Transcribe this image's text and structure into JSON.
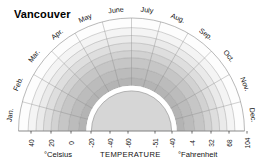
{
  "title": "Vancouver",
  "chart_data": {
    "type": "area",
    "subtype": "semicircular-polar-temperature-diagram",
    "title": "Vancouver",
    "xlabel": "TEMPERATURE",
    "angular_axis": {
      "name": "month",
      "categories": [
        "Jan.",
        "Feb.",
        "Mar.",
        "Apr.",
        "May",
        "June",
        "July",
        "Aug.",
        "Sep.",
        "Oct.",
        "Nov.",
        "Dec."
      ],
      "start_angle_deg": 180,
      "end_angle_deg": 0,
      "direction": "clockwise"
    },
    "radial_axis": {
      "name": "TEMPERATURE",
      "celsius_label": "°Celsius",
      "fahrenheit_label": "°Fahrenheit",
      "celsius_ticks_outer_to_inner": [
        40,
        20,
        0,
        -20,
        -40,
        -60
      ],
      "fahrenheit_ticks_inner_to_outer": [
        -51,
        -40,
        -4,
        32,
        68,
        104
      ],
      "celsius_tick_labels": [
        "40",
        "20",
        "0",
        "-20",
        "-40",
        "-60"
      ],
      "fahrenheit_tick_labels": [
        "-51",
        "-40",
        "-4",
        "32",
        "68",
        "104"
      ],
      "celsius_range": [
        -60,
        40
      ],
      "fahrenheit_range": [
        -51,
        104
      ],
      "direction": "decreasing outward-to-inward (celsius)"
    },
    "grid": true,
    "legend": false,
    "bands": [
      {
        "index": 0,
        "r_outer": 1.0,
        "r_inner": 0.915,
        "color": "#fdfdfd"
      },
      {
        "index": 1,
        "r_outer": 0.915,
        "r_inner": 0.845,
        "color": "#f4f4f4"
      },
      {
        "index": 2,
        "r_outer": 0.845,
        "r_inner": 0.78,
        "color": "#eaeaea"
      },
      {
        "index": 3,
        "r_outer": 0.78,
        "r_inner": 0.712,
        "color": "#dedede"
      },
      {
        "index": 4,
        "r_outer": 0.712,
        "r_inner": 0.648,
        "color": "#d2d2d2"
      },
      {
        "index": 5,
        "r_outer": 0.648,
        "r_inner": 0.56,
        "color": "#c6c6c6"
      },
      {
        "index": 6,
        "r_outer": 0.56,
        "r_inner": 0.47,
        "color": "#bcbcbc"
      },
      {
        "index": 7,
        "r_outer": 0.47,
        "r_inner": 0.4,
        "color": "#b4b4b4"
      },
      {
        "index": 8,
        "r_outer": 0.4,
        "r_inner": 0.36,
        "color": "#ffffff"
      },
      {
        "index": 9,
        "r_outer": 0.355,
        "r_inner": 0.0,
        "color": "#d6d6d6"
      }
    ],
    "colors": {
      "background": "#ffffff",
      "grid_line": "#8e8e8e",
      "outline": "#8a8a8a",
      "text": "#111111",
      "core_fill": "#d6d6d6",
      "core_ring": "#ffffff"
    }
  },
  "months": [
    {
      "label": "Jan.",
      "angle": 172.5
    },
    {
      "label": "Feb.",
      "angle": 157.5
    },
    {
      "label": "Mar.",
      "angle": 142.5
    },
    {
      "label": "Apr.",
      "angle": 127.5
    },
    {
      "label": "May",
      "angle": 112.5
    },
    {
      "label": "June",
      "angle": 97.5
    },
    {
      "label": "July",
      "angle": 82.5
    },
    {
      "label": "Aug.",
      "angle": 67.5
    },
    {
      "label": "Sep.",
      "angle": 52.5
    },
    {
      "label": "Oct.",
      "angle": 37.5
    },
    {
      "label": "Nov.",
      "angle": 22.5
    },
    {
      "label": "Dec.",
      "angle": 7.5
    }
  ],
  "celsius_ticks": [
    {
      "label": "40",
      "x": 31
    },
    {
      "label": "20",
      "x": 51
    },
    {
      "label": "0",
      "x": 71
    },
    {
      "label": "-20",
      "x": 91
    },
    {
      "label": "-40",
      "x": 110
    },
    {
      "label": "-60",
      "x": 128
    }
  ],
  "fahrenheit_ticks": [
    {
      "label": "-51",
      "x": 155
    },
    {
      "label": "-40",
      "x": 172
    },
    {
      "label": "-4",
      "x": 192
    },
    {
      "label": "32",
      "x": 211
    },
    {
      "label": "68",
      "x": 229
    },
    {
      "label": "104",
      "x": 247
    }
  ],
  "captions": {
    "celsius": "°Celsius",
    "temperature": "TEMPERATURE",
    "fahrenheit": "°Fahrenheit"
  }
}
